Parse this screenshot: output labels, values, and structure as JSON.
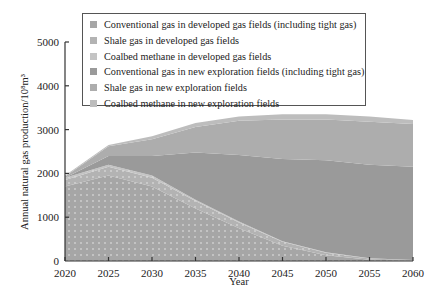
{
  "chart_data": {
    "type": "area",
    "stacked": true,
    "title": "",
    "xlabel": "Year",
    "ylabel": "Annual natural gas production/10⁸m³",
    "x": [
      2020,
      2025,
      2030,
      2035,
      2040,
      2045,
      2050,
      2055,
      2060
    ],
    "xlim": [
      2020,
      2060
    ],
    "ylim": [
      0,
      5000
    ],
    "xticks": [
      "2020",
      "2025",
      "2030",
      "2035",
      "2040",
      "2045",
      "2050",
      "2055",
      "2060"
    ],
    "yticks": [
      "0",
      "1000",
      "2000",
      "3000",
      "4000",
      "5000"
    ],
    "grid": false,
    "legend_position": "top-inside",
    "series": [
      {
        "name": "Conventional gas in developed gas fields (including tight gas)",
        "color": "#a6a6a6",
        "pattern": "dots",
        "values": [
          1700,
          1950,
          1700,
          1200,
          750,
          350,
          130,
          30,
          10
        ]
      },
      {
        "name": "Shale gas in developed gas fields",
        "color": "#b3b3b3",
        "pattern": "dots",
        "values": [
          150,
          200,
          200,
          170,
          130,
          90,
          60,
          25,
          10
        ]
      },
      {
        "name": "Coalbed methane in developed gas fields",
        "color": "#c4c4c4",
        "pattern": "dots",
        "values": [
          50,
          50,
          50,
          30,
          20,
          10,
          10,
          5,
          0
        ]
      },
      {
        "name": "Conventional gas in new exploration fields (including tight gas)",
        "color": "#9a9a9a",
        "pattern": "solid",
        "values": [
          0,
          200,
          450,
          1080,
          1520,
          1880,
          2100,
          2140,
          2130
        ]
      },
      {
        "name": "Shale gas in new exploration fields",
        "color": "#adadad",
        "pattern": "solid",
        "values": [
          30,
          220,
          380,
          580,
          780,
          900,
          930,
          980,
          980
        ]
      },
      {
        "name": "Coalbed methane in new exploration fields",
        "color": "#bdbdbd",
        "pattern": "solid",
        "values": [
          20,
          30,
          70,
          90,
          100,
          120,
          120,
          120,
          90
        ]
      }
    ]
  }
}
